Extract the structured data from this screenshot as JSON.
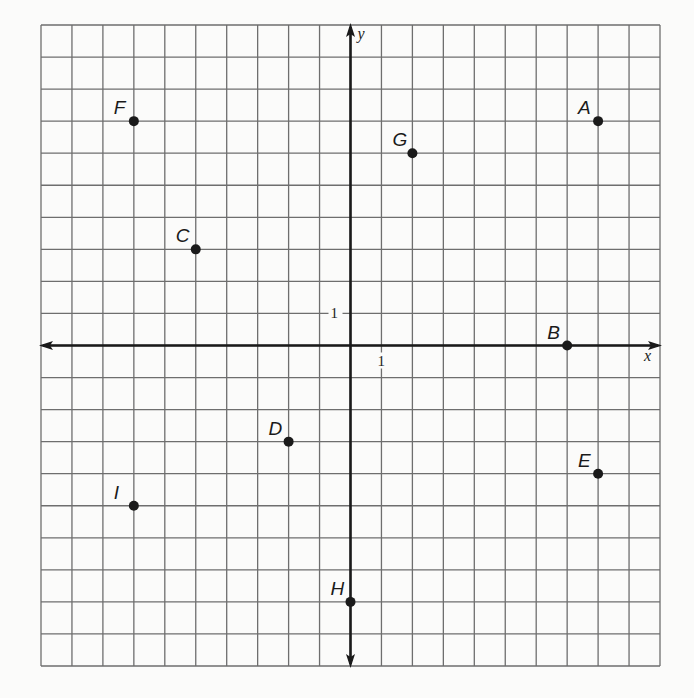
{
  "chart_data": {
    "type": "scatter",
    "title": "",
    "xlabel": "x",
    "ylabel": "y",
    "xlim": [
      -10,
      10
    ],
    "ylim": [
      -10,
      10
    ],
    "grid": true,
    "tick_labels": {
      "x": "1",
      "y": "1"
    },
    "points": [
      {
        "label": "A",
        "x": 8,
        "y": 7
      },
      {
        "label": "B",
        "x": 7,
        "y": 0
      },
      {
        "label": "C",
        "x": -5,
        "y": 3
      },
      {
        "label": "D",
        "x": -2,
        "y": -3
      },
      {
        "label": "E",
        "x": 8,
        "y": -4
      },
      {
        "label": "F",
        "x": -7,
        "y": 7
      },
      {
        "label": "G",
        "x": 2,
        "y": 6
      },
      {
        "label": "H",
        "x": 0,
        "y": -8
      },
      {
        "label": "I",
        "x": -7,
        "y": -5
      }
    ]
  },
  "colors": {
    "grid": "#6e6e6e",
    "axis": "#1a1a1a",
    "point": "#1a1a1a",
    "background": "#fbfbfa"
  }
}
